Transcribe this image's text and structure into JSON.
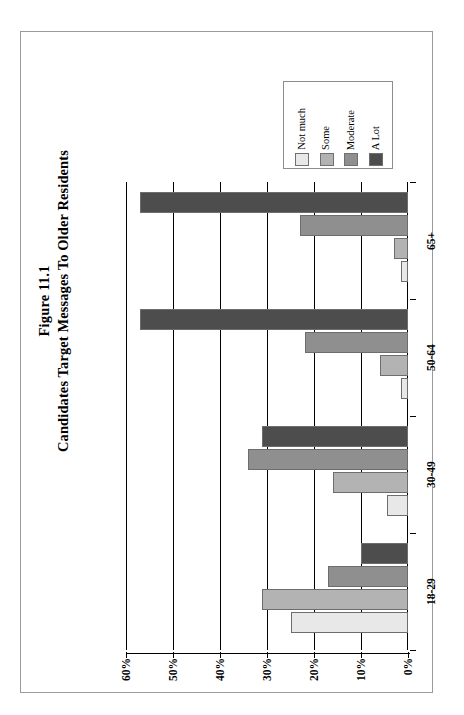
{
  "figure": {
    "title_line1": "Figure 11.1",
    "title_line2": "Candidates Target Messages To Older Residents"
  },
  "legend": {
    "items": [
      {
        "label": "Not much",
        "color": "#e8e8e8"
      },
      {
        "label": "Some",
        "color": "#b3b3b3"
      },
      {
        "label": "Moderate",
        "color": "#8f8f8f"
      },
      {
        "label": "A Lot",
        "color": "#4d4d4d"
      }
    ]
  },
  "axis": {
    "value_ticks": [
      "60%",
      "50%",
      "40%",
      "30%",
      "20%",
      "10%",
      "0%"
    ],
    "category_ticks": [
      "65+",
      "50-64",
      "30-49",
      "18-29"
    ]
  },
  "chart_data": {
    "type": "bar",
    "orientation": "horizontal",
    "xlabel": "",
    "ylabel": "",
    "xlim": [
      0,
      60
    ],
    "x_axis_reversed": true,
    "grid": true,
    "legend_position": "top-right",
    "categories": [
      "65+",
      "50-64",
      "30-49",
      "18-29"
    ],
    "series": [
      {
        "name": "Not much",
        "color": "#e8e8e8",
        "values": [
          1.5,
          1.5,
          4.5,
          25
        ]
      },
      {
        "name": "Some",
        "color": "#b3b3b3",
        "values": [
          3,
          6,
          16,
          31
        ]
      },
      {
        "name": "Moderate",
        "color": "#8f8f8f",
        "values": [
          23,
          22,
          34,
          17
        ]
      },
      {
        "name": "A Lot",
        "color": "#4d4d4d",
        "values": [
          57,
          57,
          31,
          10
        ]
      }
    ]
  }
}
